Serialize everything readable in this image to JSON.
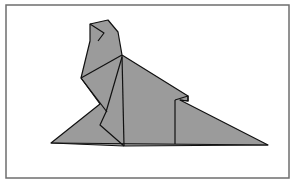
{
  "figure": {
    "frame": {
      "x": 6,
      "y": 5,
      "width": 283,
      "height": 173,
      "stroke": "#6e6e6e",
      "fill": "#ffffff"
    },
    "colors": {
      "fill": "#9b9b9b",
      "stroke": "#111111"
    },
    "polygons": {
      "body": "51,143 100,104 81,78 90,41 90,24 108,20 118,32 122,55 188,96 188,101 180,100 268,145 124,146",
      "head_fold": "90,24 104,33 98,41"
    },
    "lines": [
      {
        "name": "head-crease",
        "points": "90,24 104,33 98,41"
      },
      {
        "name": "neck-front",
        "points": "81,78 122,55"
      },
      {
        "name": "neck-back-spine",
        "points": "122,55 124,146"
      },
      {
        "name": "chest-crease",
        "points": "122,57 106,112 100,125 124,146"
      },
      {
        "name": "chest-lower",
        "points": "81,78 107,112"
      },
      {
        "name": "base-line",
        "points": "51,143 268,145"
      },
      {
        "name": "back-vertical",
        "points": "175,100 175,144"
      },
      {
        "name": "back-notch",
        "points": "175,100 188,96 188,101 180,100"
      }
    ]
  }
}
